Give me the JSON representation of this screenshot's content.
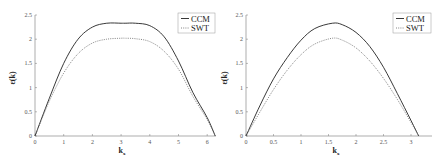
{
  "chart_data": [
    {
      "type": "line",
      "title": "",
      "xlabel": "k_x",
      "ylabel": "ε(k)",
      "xlim": [
        0,
        6.28
      ],
      "ylim": [
        0,
        2.5
      ],
      "xticks": [
        "0",
        "1",
        "2",
        "3",
        "4",
        "5",
        "6"
      ],
      "yticks": [
        "0",
        "0.5",
        "1",
        "1.5",
        "2",
        "2.5"
      ],
      "grid": false,
      "legend_position": "upper right",
      "x": [
        0,
        0.5,
        1.0,
        1.5,
        2.0,
        2.5,
        3.0,
        3.14,
        3.5,
        4.0,
        4.5,
        5.0,
        5.5,
        6.0,
        6.28
      ],
      "series": [
        {
          "name": "CCM",
          "style": "solid",
          "values": [
            0,
            0.78,
            1.5,
            2.0,
            2.25,
            2.33,
            2.33,
            2.33,
            2.33,
            2.28,
            2.05,
            1.55,
            0.9,
            0.38,
            0
          ]
        },
        {
          "name": "SWT",
          "style": "dotted",
          "values": [
            0,
            0.72,
            1.3,
            1.7,
            1.92,
            2.0,
            2.02,
            2.02,
            2.01,
            1.95,
            1.75,
            1.38,
            0.82,
            0.34,
            0
          ]
        }
      ]
    },
    {
      "type": "line",
      "title": "",
      "xlabel": "k_x",
      "ylabel": "ε(k)",
      "xlim": [
        0,
        3.14
      ],
      "ylim": [
        0,
        2.5
      ],
      "xticks": [
        "0",
        "0.5",
        "1",
        "1.5",
        "2",
        "2.5",
        "3"
      ],
      "yticks": [
        "0",
        "0.5",
        "1",
        "1.5",
        "2",
        "2.5"
      ],
      "grid": false,
      "legend_position": "upper right",
      "x": [
        0,
        0.25,
        0.5,
        0.75,
        1.0,
        1.25,
        1.57,
        1.75,
        2.0,
        2.25,
        2.5,
        2.75,
        3.0,
        3.14
      ],
      "series": [
        {
          "name": "CCM",
          "style": "solid",
          "values": [
            0,
            0.62,
            1.18,
            1.62,
            1.98,
            2.22,
            2.33,
            2.3,
            2.14,
            1.85,
            1.42,
            0.88,
            0.32,
            0
          ]
        },
        {
          "name": "SWT",
          "style": "dotted",
          "values": [
            0,
            0.49,
            0.96,
            1.36,
            1.68,
            1.9,
            2.02,
            1.98,
            1.82,
            1.55,
            1.19,
            0.76,
            0.28,
            0
          ]
        }
      ]
    }
  ],
  "legend": {
    "ccm": "CCM",
    "swt": "SWT"
  },
  "labels": {
    "xlabel_main": "k",
    "xlabel_sub": "x",
    "ylabel": "ε(k)"
  },
  "left_ticks": {
    "x": [
      "0",
      "1",
      "2",
      "3",
      "4",
      "5",
      "6"
    ],
    "y": [
      "0",
      "0.5",
      "1",
      "1.5",
      "2",
      "2.5"
    ]
  },
  "right_ticks": {
    "x": [
      "0",
      "0.5",
      "1",
      "1.5",
      "2",
      "2.5",
      "3"
    ],
    "y": [
      "0",
      "0.5",
      "1",
      "1.5",
      "2",
      "2.5"
    ]
  }
}
